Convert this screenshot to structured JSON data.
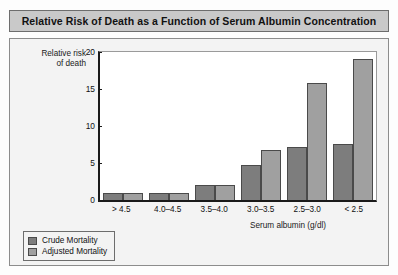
{
  "title": "Relative Risk of Death as a Function of Serum Albumin Concentration",
  "chart_data": {
    "type": "bar",
    "title": "Relative Risk of Death as a Function of Serum Albumin Concentration",
    "xlabel": "Serum albumin (g/dl)",
    "ylabel": "Relative risk\nof death",
    "ylabel_line1": "Relative risk",
    "ylabel_line2": "of death",
    "categories": [
      "> 4.5",
      "4.0–4.5",
      "3.5–4.0",
      "3.0–3.5",
      "2.5–3.0",
      "< 2.5"
    ],
    "series": [
      {
        "name": "Crude Mortality",
        "color": "#7d7d7d",
        "values": [
          1.0,
          1.0,
          2.0,
          4.7,
          7.1,
          7.6
        ]
      },
      {
        "name": "Adjusted Mortality",
        "color": "#a0a0a0",
        "values": [
          1.0,
          1.0,
          2.0,
          6.7,
          15.8,
          19.1
        ]
      }
    ],
    "ylim": [
      0,
      20
    ],
    "yticks": [
      0,
      5,
      10,
      15,
      20
    ],
    "ytick_labels": [
      "0",
      "5",
      "10",
      "15",
      "20"
    ],
    "grid": false,
    "legend_position": "bottom-left"
  },
  "legend": {
    "items": [
      {
        "label": "Crude Mortality",
        "color": "#7d7d7d"
      },
      {
        "label": "Adjusted Mortality",
        "color": "#a0a0a0"
      }
    ]
  }
}
